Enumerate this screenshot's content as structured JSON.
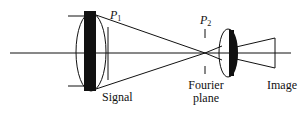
{
  "diagram": {
    "type": "optical-4f-system",
    "colors": {
      "line": "#111111",
      "fill": "#111111",
      "background": "#ffffff"
    },
    "labels": {
      "p1": {
        "symbol": "P",
        "subscript": "1"
      },
      "p2": {
        "symbol": "P",
        "subscript": "2"
      },
      "signal": "Signal",
      "fourier_line1": "Fourier",
      "fourier_line2": "plane",
      "image": "Image"
    },
    "elements": [
      {
        "id": "optical-axis",
        "kind": "line"
      },
      {
        "id": "lens-1",
        "kind": "converging-lens",
        "with_signal_mask": true
      },
      {
        "id": "plane-p1",
        "kind": "plane-marker"
      },
      {
        "id": "plane-p2",
        "kind": "dashed-plane-marker"
      },
      {
        "id": "lens-2",
        "kind": "converging-lens"
      },
      {
        "id": "image-cone",
        "kind": "ray-bundle"
      }
    ]
  }
}
